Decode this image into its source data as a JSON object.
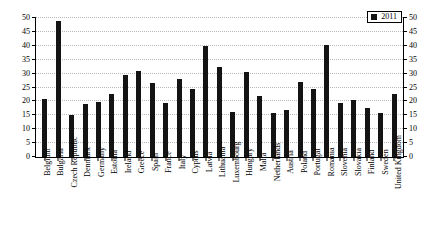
{
  "chart_data": {
    "type": "bar",
    "title": "",
    "xlabel": "",
    "ylabel": "",
    "ylim": [
      0,
      50
    ],
    "ytick_step": 5,
    "yticks": [
      0,
      5,
      10,
      15,
      20,
      25,
      30,
      35,
      40,
      45,
      50
    ],
    "grid": true,
    "mirrored_y_axis": true,
    "legend_position": "top-right",
    "legend": [
      "2011"
    ],
    "bar_color": "#141414",
    "categories": [
      "Belgium",
      "Bulgaria",
      "Czech Republic",
      "Denmark",
      "Germany",
      "Estonia",
      "Ireland",
      "Greece",
      "Spain",
      "France",
      "Italy",
      "Cyprus",
      "Latvia",
      "Lithuania",
      "Luxembourg",
      "Hungary",
      "Malta",
      "Netherlands",
      "Austria",
      "Poland",
      "Portugal",
      "Romania",
      "Slovenia",
      "Slovakia",
      "Finland",
      "Sweden",
      "United Kingdom"
    ],
    "series": [
      {
        "name": "2011",
        "values": [
          21.0,
          49.0,
          15.0,
          18.9,
          19.8,
          22.8,
          29.4,
          31.0,
          26.7,
          19.3,
          28.1,
          24.3,
          40.1,
          32.3,
          16.2,
          30.5,
          21.9,
          15.7,
          16.9,
          27.0,
          24.6,
          40.2,
          19.4,
          20.5,
          17.8,
          15.8,
          22.7
        ]
      }
    ]
  }
}
